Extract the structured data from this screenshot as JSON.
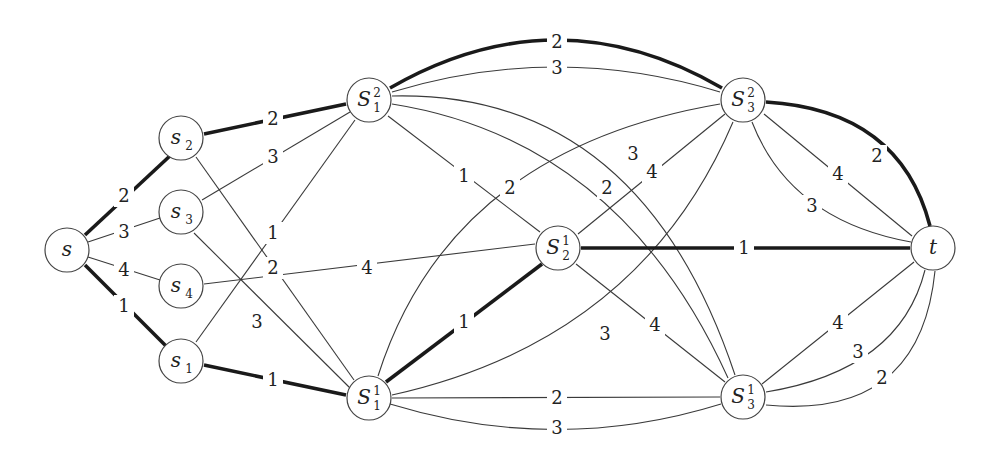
{
  "diagram": {
    "type": "flow-network",
    "nodes": [
      {
        "id": "s",
        "label": "s",
        "sub": "",
        "sup": "",
        "x": 67,
        "y": 250
      },
      {
        "id": "s2",
        "label": "s",
        "sub": "2",
        "sup": "",
        "x": 181,
        "y": 138
      },
      {
        "id": "s3",
        "label": "s",
        "sub": "3",
        "sup": "",
        "x": 181,
        "y": 212
      },
      {
        "id": "s4",
        "label": "s",
        "sub": "4",
        "sup": "",
        "x": 181,
        "y": 286
      },
      {
        "id": "s1",
        "label": "s",
        "sub": "1",
        "sup": "",
        "x": 181,
        "y": 361
      },
      {
        "id": "S12",
        "label": "S",
        "sub": "1",
        "sup": "2",
        "x": 369,
        "y": 100
      },
      {
        "id": "S11",
        "label": "S",
        "sub": "1",
        "sup": "1",
        "x": 369,
        "y": 398
      },
      {
        "id": "S21",
        "label": "S",
        "sub": "2",
        "sup": "1",
        "x": 558,
        "y": 248
      },
      {
        "id": "S32",
        "label": "S",
        "sub": "3",
        "sup": "2",
        "x": 743,
        "y": 100
      },
      {
        "id": "S31",
        "label": "S",
        "sub": "3",
        "sup": "1",
        "x": 743,
        "y": 397
      },
      {
        "id": "t",
        "label": "t",
        "sub": "",
        "sup": "",
        "x": 933,
        "y": 248
      }
    ],
    "edges": [
      {
        "from": "s",
        "to": "s2",
        "weight": "2",
        "bold": true,
        "lx": 124,
        "ly": 196,
        "path": "M 85 235 L 172 154"
      },
      {
        "from": "s",
        "to": "s3",
        "weight": "3",
        "bold": false,
        "lx": 124,
        "ly": 232,
        "path": "M 88 242 L 160 218"
      },
      {
        "from": "s",
        "to": "s4",
        "weight": "4",
        "bold": false,
        "lx": 124,
        "ly": 270,
        "path": "M 88 257 L 160 280"
      },
      {
        "from": "s",
        "to": "s1",
        "weight": "1",
        "bold": true,
        "lx": 124,
        "ly": 306,
        "path": "M 85 265 L 166 346"
      },
      {
        "from": "s2",
        "to": "S12",
        "weight": "2",
        "bold": true,
        "lx": 273,
        "ly": 119,
        "path": "M 204 134 L 346 104"
      },
      {
        "from": "s3",
        "to": "S12",
        "weight": "3",
        "bold": false,
        "lx": 273,
        "ly": 157,
        "path": "M 202 200 L 350 112"
      },
      {
        "from": "s1",
        "to": "S12",
        "weight": "1",
        "bold": false,
        "lx": 273,
        "ly": 233,
        "path": "M 196 342 L 355 120"
      },
      {
        "from": "s2",
        "to": "S11",
        "weight": "2",
        "bold": false,
        "lx": 273,
        "ly": 268,
        "path": "M 196 157 L 354 380"
      },
      {
        "from": "s3",
        "to": "S11",
        "weight": "3",
        "bold": false,
        "lx": 257,
        "ly": 322,
        "path": "M 194 233 L 350 388"
      },
      {
        "from": "s4",
        "to": "S21",
        "weight": "4",
        "bold": false,
        "lx": 367,
        "ly": 268,
        "path": "M 204 284 L 535 244"
      },
      {
        "from": "s1",
        "to": "S11",
        "weight": "1",
        "bold": true,
        "lx": 273,
        "ly": 380,
        "path": "M 204 365 L 346 395"
      },
      {
        "from": "S12",
        "to": "S32",
        "weight": "2",
        "bold": true,
        "lx": 557,
        "ly": 42,
        "path": "M 390 88 Q 557 -8 722 88"
      },
      {
        "from": "S12",
        "to": "S32",
        "weight": "3",
        "bold": false,
        "lx": 557,
        "ly": 68,
        "path": "M 392 92 Q 557 42 720 92"
      },
      {
        "from": "S12",
        "to": "S21",
        "weight": "1",
        "bold": false,
        "lx": 464,
        "ly": 176,
        "path": "M 388 116 L 540 232"
      },
      {
        "from": "S12",
        "to": "S31",
        "weight": "3",
        "bold": false,
        "lx": 633,
        "ly": 154,
        "path": "M 392 96 Q 640 90 735 375"
      },
      {
        "from": "S12",
        "to": "S31",
        "weight": "2",
        "bold": false,
        "lx": 607,
        "ly": 188,
        "path": "M 392 104 Q 620 140 728 378"
      },
      {
        "from": "S32",
        "to": "S11",
        "weight": "2",
        "bold": false,
        "lx": 510,
        "ly": 188,
        "path": "M 720 104 Q 450 150 378 376"
      },
      {
        "from": "S32",
        "to": "S21",
        "weight": "4",
        "bold": false,
        "lx": 652,
        "ly": 172,
        "path": "M 725 114 L 578 234"
      },
      {
        "from": "S32",
        "to": "S11",
        "weight": "3",
        "bold": false,
        "lx": 605,
        "ly": 334,
        "path": "M 733 122 Q 640 340 392 395"
      },
      {
        "from": "S32",
        "to": "t",
        "weight": "2",
        "bold": true,
        "lx": 877,
        "ly": 156,
        "path": "M 766 102 Q 900 110 930 226"
      },
      {
        "from": "S32",
        "to": "t",
        "weight": "4",
        "bold": false,
        "lx": 838,
        "ly": 174,
        "path": "M 764 114 L 912 236"
      },
      {
        "from": "S32",
        "to": "t",
        "weight": "3",
        "bold": false,
        "lx": 812,
        "ly": 206,
        "path": "M 752 122 Q 790 220 911 242"
      },
      {
        "from": "S21",
        "to": "t",
        "weight": "1",
        "bold": true,
        "lx": 744,
        "ly": 248,
        "path": "M 581 248 L 910 248"
      },
      {
        "from": "S11",
        "to": "S21",
        "weight": "1",
        "bold": true,
        "lx": 464,
        "ly": 322,
        "path": "M 386 382 L 542 264"
      },
      {
        "from": "S21",
        "to": "S31",
        "weight": "4",
        "bold": false,
        "lx": 655,
        "ly": 325,
        "path": "M 576 264 L 725 382"
      },
      {
        "from": "S11",
        "to": "S31",
        "weight": "2",
        "bold": false,
        "lx": 557,
        "ly": 398,
        "path": "M 392 398 L 720 397"
      },
      {
        "from": "S11",
        "to": "S31",
        "weight": "3",
        "bold": false,
        "lx": 557,
        "ly": 428,
        "path": "M 390 404 Q 557 455 721 404"
      },
      {
        "from": "S31",
        "to": "t",
        "weight": "4",
        "bold": false,
        "lx": 838,
        "ly": 323,
        "path": "M 762 384 L 914 262"
      },
      {
        "from": "S31",
        "to": "t",
        "weight": "3",
        "bold": false,
        "lx": 858,
        "ly": 352,
        "path": "M 766 392 Q 900 370 925 270"
      },
      {
        "from": "S31",
        "to": "t",
        "weight": "2",
        "bold": false,
        "lx": 882,
        "ly": 378,
        "path": "M 766 405 Q 920 420 935 271"
      }
    ]
  }
}
